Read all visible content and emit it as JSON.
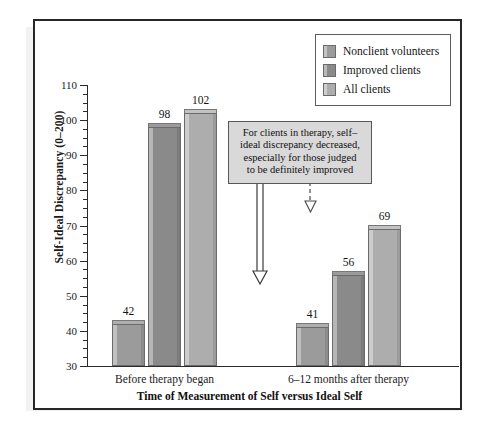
{
  "figure": {
    "background_color": "#ffffff",
    "frame_color": "#262626",
    "shadow_color": "#f2f2f2"
  },
  "legend": {
    "items": [
      {
        "label": "Nonclient volunteers",
        "color": "#9b9b9b"
      },
      {
        "label": "Improved clients",
        "color": "#8a8a8a"
      },
      {
        "label": "All clients",
        "color": "#adadad"
      }
    ]
  },
  "annotation": {
    "text": "For clients in therapy, self–\nideal discrepancy decreased,\nespecially for those judged\nto be definitely improved",
    "background_color": "#d9d9d9",
    "border_color": "#585858",
    "arrows": [
      {
        "name": "arrow-to-improved-clients",
        "style": "solid",
        "target_value": 56
      },
      {
        "name": "arrow-to-all-clients",
        "style": "dashed",
        "target_value": 69
      }
    ]
  },
  "chart_data": {
    "type": "bar",
    "title": "",
    "xlabel": "Time of Measurement of Self versus Ideal Self",
    "ylabel": "Self-Ideal Discrepancy (0–200)",
    "categories": [
      "Before therapy began",
      "6–12 months after therapy"
    ],
    "series": [
      {
        "name": "Nonclient volunteers",
        "values": [
          42,
          41
        ],
        "color": "#9b9b9b"
      },
      {
        "name": "Improved clients",
        "values": [
          98,
          56
        ],
        "color": "#8a8a8a"
      },
      {
        "name": "All clients",
        "values": [
          102,
          69
        ],
        "color": "#adadad"
      }
    ],
    "ylim": [
      30,
      110
    ],
    "ytick_labels": [
      "30",
      "40",
      "50",
      "60",
      "70",
      "80",
      "90",
      "100",
      "110"
    ],
    "ytick_values": [
      30,
      40,
      50,
      60,
      70,
      80,
      90,
      100,
      110
    ],
    "yminor_step": 2.5,
    "grid": false,
    "legend_position": "top-right",
    "data_labels": true
  }
}
